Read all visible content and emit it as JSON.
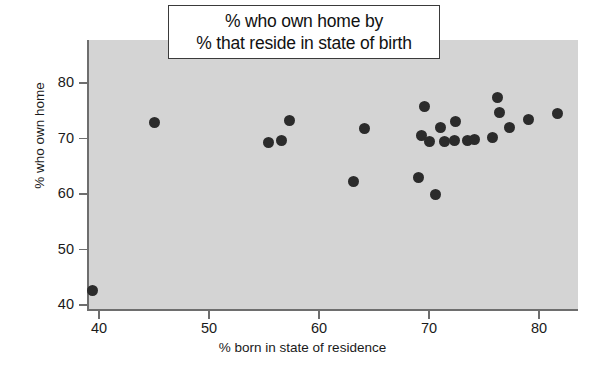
{
  "chart_data": {
    "type": "scatter",
    "title": "% who own home by\n% that reside in state of birth",
    "title_lines": [
      "% who own home by",
      "% that reside in state of birth"
    ],
    "xlabel": "% born in state of residence",
    "ylabel": "% who own home",
    "xlim": [
      38,
      83
    ],
    "ylim": [
      39,
      81
    ],
    "xticks": [
      40,
      50,
      60,
      70,
      80
    ],
    "yticks": [
      40,
      50,
      60,
      70,
      80
    ],
    "grid": false,
    "legend": null,
    "marker": "filled-circle",
    "marker_color": "#2b2b2b",
    "panel_color": "#d4d4d4",
    "points": [
      {
        "x": 39.4,
        "y": 42.7
      },
      {
        "x": 45.0,
        "y": 72.9
      },
      {
        "x": 55.4,
        "y": 69.2
      },
      {
        "x": 56.6,
        "y": 69.7
      },
      {
        "x": 57.3,
        "y": 73.2
      },
      {
        "x": 63.1,
        "y": 62.3
      },
      {
        "x": 64.1,
        "y": 71.8
      },
      {
        "x": 69.0,
        "y": 62.9
      },
      {
        "x": 69.3,
        "y": 70.6
      },
      {
        "x": 69.6,
        "y": 75.7
      },
      {
        "x": 70.0,
        "y": 69.4
      },
      {
        "x": 70.6,
        "y": 59.9
      },
      {
        "x": 71.0,
        "y": 72.0
      },
      {
        "x": 71.4,
        "y": 69.4
      },
      {
        "x": 72.3,
        "y": 69.6
      },
      {
        "x": 72.4,
        "y": 73.0
      },
      {
        "x": 73.5,
        "y": 69.7
      },
      {
        "x": 74.1,
        "y": 69.8
      },
      {
        "x": 75.8,
        "y": 70.2
      },
      {
        "x": 76.2,
        "y": 77.4
      },
      {
        "x": 76.4,
        "y": 74.6
      },
      {
        "x": 77.3,
        "y": 71.9
      },
      {
        "x": 79.0,
        "y": 73.4
      },
      {
        "x": 81.7,
        "y": 74.5
      }
    ]
  },
  "axes": {
    "y_tick_labels": [
      "80",
      "70",
      "60",
      "50",
      "40"
    ],
    "x_tick_labels": [
      "40",
      "50",
      "60",
      "70",
      "80"
    ]
  }
}
